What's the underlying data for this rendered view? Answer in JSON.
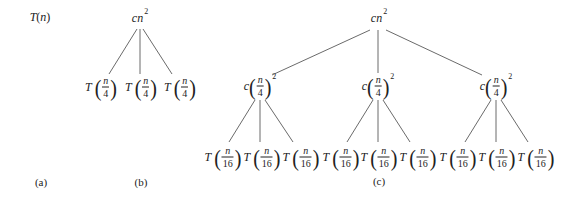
{
  "figure": {
    "parts": [
      {
        "id": "a",
        "caption": "(a)",
        "root": {
          "func": "T",
          "arg": "n"
        }
      },
      {
        "id": "b",
        "caption": "(b)",
        "root": {
          "coef": "c",
          "var": "n",
          "exp": "2"
        },
        "children": [
          {
            "func": "T",
            "num": "n",
            "den": "4"
          },
          {
            "func": "T",
            "num": "n",
            "den": "4"
          },
          {
            "func": "T",
            "num": "n",
            "den": "4"
          }
        ]
      },
      {
        "id": "c",
        "caption": "(c)",
        "root": {
          "coef": "c",
          "var": "n",
          "exp": "2"
        },
        "level1": [
          {
            "coef": "c",
            "num": "n",
            "den": "4",
            "exp": "2"
          },
          {
            "coef": "c",
            "num": "n",
            "den": "4",
            "exp": "2"
          },
          {
            "coef": "c",
            "num": "n",
            "den": "4",
            "exp": "2"
          }
        ],
        "level2": [
          {
            "func": "T",
            "num": "n",
            "den": "16"
          },
          {
            "func": "T",
            "num": "n",
            "den": "16"
          },
          {
            "func": "T",
            "num": "n",
            "den": "16"
          },
          {
            "func": "T",
            "num": "n",
            "den": "16"
          },
          {
            "func": "T",
            "num": "n",
            "den": "16"
          },
          {
            "func": "T",
            "num": "n",
            "den": "16"
          },
          {
            "func": "T",
            "num": "n",
            "den": "16"
          },
          {
            "func": "T",
            "num": "n",
            "den": "16"
          },
          {
            "func": "T",
            "num": "n",
            "den": "16"
          }
        ]
      }
    ]
  }
}
